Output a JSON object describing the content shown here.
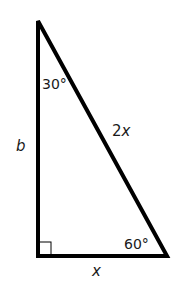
{
  "diagram": {
    "type": "right-triangle",
    "vertices": {
      "top": {
        "x": 38,
        "y": 21
      },
      "bottom_left": {
        "x": 38,
        "y": 256
      },
      "bottom_right": {
        "x": 167,
        "y": 256
      }
    },
    "labels": {
      "top_angle": "30°",
      "bottom_right_angle": "60°",
      "hypotenuse": "2x",
      "vertical_side": "b",
      "horizontal_side": "x"
    },
    "right_angle_marker": true,
    "stroke_color": "#000000"
  }
}
